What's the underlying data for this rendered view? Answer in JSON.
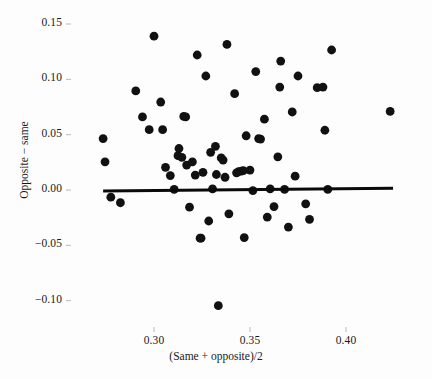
{
  "chart_data": {
    "type": "scatter",
    "title": "",
    "xlabel": "(Same + opposite)/2",
    "ylabel": "Opposite − same",
    "xlim": [
      0.268,
      0.432
    ],
    "ylim": [
      -0.118,
      0.163
    ],
    "xticks": [
      0.3,
      0.35,
      0.4
    ],
    "xtick_labels": [
      "0.30",
      "0.35",
      "0.40"
    ],
    "yticks": [
      0.15,
      0.1,
      0.05,
      0.0,
      -0.05,
      -0.1
    ],
    "ytick_labels": [
      "0.15",
      "0.10",
      "0.05",
      "0.00",
      "−0.05",
      "−0.10"
    ],
    "grid": false,
    "legend": null,
    "marker": {
      "shape": "circle",
      "color": "#111111",
      "size": 4.4
    },
    "points": [
      {
        "x": 0.2735,
        "y": 0.0465
      },
      {
        "x": 0.2745,
        "y": 0.0255
      },
      {
        "x": 0.2775,
        "y": -0.0065
      },
      {
        "x": 0.2825,
        "y": -0.0115
      },
      {
        "x": 0.2905,
        "y": 0.0895
      },
      {
        "x": 0.294,
        "y": 0.066
      },
      {
        "x": 0.2975,
        "y": 0.0545
      },
      {
        "x": 0.3,
        "y": 0.139
      },
      {
        "x": 0.3035,
        "y": 0.0795
      },
      {
        "x": 0.3045,
        "y": 0.0545
      },
      {
        "x": 0.306,
        "y": 0.0205
      },
      {
        "x": 0.3085,
        "y": 0.013
      },
      {
        "x": 0.3105,
        "y": 0.0005
      },
      {
        "x": 0.3125,
        "y": 0.031
      },
      {
        "x": 0.313,
        "y": 0.0375
      },
      {
        "x": 0.3145,
        "y": 0.0295
      },
      {
        "x": 0.3155,
        "y": 0.0665
      },
      {
        "x": 0.3165,
        "y": 0.066
      },
      {
        "x": 0.317,
        "y": 0.0225
      },
      {
        "x": 0.3185,
        "y": -0.0155
      },
      {
        "x": 0.32,
        "y": 0.0255
      },
      {
        "x": 0.3215,
        "y": 0.0135
      },
      {
        "x": 0.3225,
        "y": 0.122
      },
      {
        "x": 0.324,
        "y": -0.0435
      },
      {
        "x": 0.3245,
        "y": -0.0435
      },
      {
        "x": 0.3255,
        "y": 0.016
      },
      {
        "x": 0.327,
        "y": 0.103
      },
      {
        "x": 0.3285,
        "y": -0.028
      },
      {
        "x": 0.3295,
        "y": 0.034
      },
      {
        "x": 0.3305,
        "y": 0.001
      },
      {
        "x": 0.332,
        "y": 0.0395
      },
      {
        "x": 0.3325,
        "y": 0.014
      },
      {
        "x": 0.3335,
        "y": -0.1045
      },
      {
        "x": 0.335,
        "y": 0.029
      },
      {
        "x": 0.336,
        "y": 0.027
      },
      {
        "x": 0.337,
        "y": 0.0115
      },
      {
        "x": 0.338,
        "y": 0.1315
      },
      {
        "x": 0.339,
        "y": -0.0215
      },
      {
        "x": 0.342,
        "y": 0.087
      },
      {
        "x": 0.343,
        "y": 0.0155
      },
      {
        "x": 0.344,
        "y": 0.0165
      },
      {
        "x": 0.3455,
        "y": 0.017
      },
      {
        "x": 0.3465,
        "y": 0.0175
      },
      {
        "x": 0.347,
        "y": -0.043
      },
      {
        "x": 0.348,
        "y": 0.049
      },
      {
        "x": 0.35,
        "y": 0.018
      },
      {
        "x": 0.3515,
        "y": -0.0005
      },
      {
        "x": 0.353,
        "y": 0.107
      },
      {
        "x": 0.3545,
        "y": 0.0465
      },
      {
        "x": 0.3555,
        "y": 0.046
      },
      {
        "x": 0.3575,
        "y": 0.064
      },
      {
        "x": 0.359,
        "y": -0.0245
      },
      {
        "x": 0.3605,
        "y": 0.001
      },
      {
        "x": 0.3625,
        "y": -0.015
      },
      {
        "x": 0.3645,
        "y": 0.03
      },
      {
        "x": 0.3655,
        "y": 0.093
      },
      {
        "x": 0.366,
        "y": 0.1165
      },
      {
        "x": 0.368,
        "y": 0.0005
      },
      {
        "x": 0.37,
        "y": -0.0335
      },
      {
        "x": 0.372,
        "y": 0.0705
      },
      {
        "x": 0.3735,
        "y": 0.0125
      },
      {
        "x": 0.375,
        "y": 0.103
      },
      {
        "x": 0.379,
        "y": -0.0125
      },
      {
        "x": 0.381,
        "y": -0.0265
      },
      {
        "x": 0.385,
        "y": 0.0925
      },
      {
        "x": 0.388,
        "y": 0.093
      },
      {
        "x": 0.389,
        "y": 0.054
      },
      {
        "x": 0.3905,
        "y": 0.0005
      },
      {
        "x": 0.3925,
        "y": 0.1265
      },
      {
        "x": 0.423,
        "y": 0.071
      }
    ],
    "fit_line": {
      "style": "solid",
      "color": "#0a0a0a",
      "width": 3.0,
      "x_start": 0.2735,
      "y_start": -0.0008,
      "x_end": 0.4245,
      "y_end": 0.0015
    }
  }
}
